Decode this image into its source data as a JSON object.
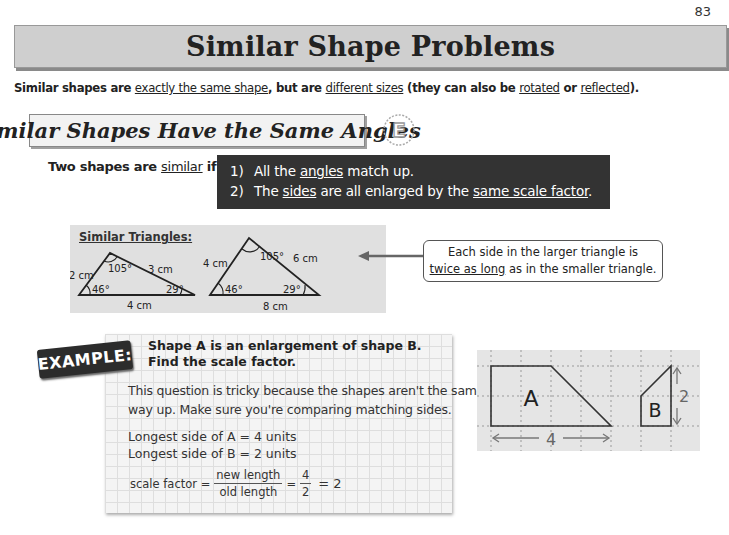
{
  "page": {
    "number": "83"
  },
  "title": "Similar Shape Problems",
  "intro": {
    "t1": "Similar shapes are ",
    "u1": "exactly the same shape",
    "t2": ", but are ",
    "u2": "different sizes",
    "t3": " (they can also be ",
    "u3": "rotated",
    "t4": " or ",
    "u4": "reflected",
    "t5": ")."
  },
  "section": {
    "heading": "Similar Shapes Have the Same Angles",
    "badge": "E",
    "condition_lead_1": "Two shapes are ",
    "condition_lead_u": "similar",
    "condition_lead_2": " if:",
    "rules": [
      {
        "num": "1)",
        "t1": "All the ",
        "u1": "angles",
        "t2": " match up.",
        "u2": "",
        "t3": ""
      },
      {
        "num": "2)",
        "t1": "The ",
        "u1": "sides",
        "t2": " are all enlarged by the ",
        "u2": "same scale factor",
        "t3": "."
      }
    ]
  },
  "triangles": {
    "label": "Similar Triangles:",
    "small": {
      "left_side": "2 cm",
      "right_side": "3 cm",
      "base": "4 cm",
      "top_angle": "105°",
      "left_angle": "46°",
      "right_angle": "29°"
    },
    "large": {
      "left_side": "4 cm",
      "right_side": "6 cm",
      "base": "8 cm",
      "top_angle": "105°",
      "left_angle": "46°",
      "right_angle": "29°"
    }
  },
  "callout": {
    "line1": "Each side in the larger triangle is",
    "line2_u": "twice as long",
    "line2_rest": " as in the smaller triangle."
  },
  "example": {
    "label": "EXAMPLE:",
    "question_line1": "Shape A is an enlargement of shape B.",
    "question_line2": "Find the scale factor.",
    "note_line1": "This question is tricky because the shapes aren't the same",
    "note_line2": "way up.  Make sure you're comparing matching sides.",
    "step1": "Longest side of A = 4 units",
    "step2": "Longest side of B = 2 units",
    "formula": {
      "lhs": "scale factor =",
      "num": "new length",
      "den": "old length",
      "eq1": "=",
      "num2": "4",
      "den2": "2",
      "result": "= 2"
    }
  },
  "diagram": {
    "shape_a_label": "A",
    "shape_b_label": "B",
    "a_dimension": "4",
    "b_dimension": "2"
  },
  "colors": {
    "title_bar": "#cfcfcf",
    "rule_box": "#333333",
    "triangle_panel": "#e0e0e0",
    "grid_panel": "#e5e5e5"
  }
}
